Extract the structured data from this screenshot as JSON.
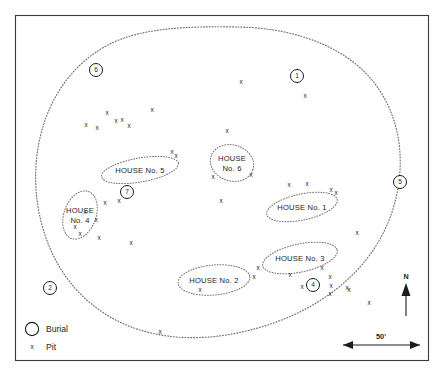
{
  "figure": {
    "type": "archaeological-site-plan"
  },
  "houses": [
    {
      "id": "house-1",
      "label": "HOUSE No. 1",
      "label_lines": [
        "HOUSE No. 1"
      ],
      "cx": 302,
      "cy": 207,
      "rx": 36,
      "ry": 13,
      "rotate": -12
    },
    {
      "id": "house-2",
      "label": "HOUSE No. 2",
      "label_lines": [
        "HOUSE No. 2"
      ],
      "cx": 214,
      "cy": 280,
      "rx": 36,
      "ry": 15,
      "rotate": -5
    },
    {
      "id": "house-3",
      "label": "HOUSE No. 3",
      "label_lines": [
        "HOUSE No. 3"
      ],
      "cx": 300,
      "cy": 258,
      "rx": 38,
      "ry": 14,
      "rotate": -12
    },
    {
      "id": "house-4",
      "label": "HOUSE No. 4",
      "label_lines": [
        "HOUSE",
        "No. 4"
      ],
      "cx": 80,
      "cy": 215,
      "rx": 16,
      "ry": 25,
      "rotate": 20
    },
    {
      "id": "house-5",
      "label": "HOUSE No. 5",
      "label_lines": [
        "HOUSE No. 5"
      ],
      "cx": 140,
      "cy": 170,
      "rx": 39,
      "ry": 12,
      "rotate": -10
    },
    {
      "id": "house-6",
      "label": "HOUSE No. 6",
      "label_lines": [
        "HOUSE",
        "No. 6"
      ],
      "cx": 232,
      "cy": 163,
      "rx": 22,
      "ry": 18,
      "rotate": 18
    }
  ],
  "burials": [
    {
      "id": "burial-6",
      "number": "6",
      "cx": 96,
      "cy": 70,
      "r": 6.5
    },
    {
      "id": "burial-1",
      "number": "1",
      "cx": 297,
      "cy": 76,
      "r": 6.5
    },
    {
      "id": "burial-5",
      "number": "5",
      "cx": 400,
      "cy": 182,
      "r": 6.5
    },
    {
      "id": "burial-7-house5",
      "number": "7",
      "cx": 127,
      "cy": 192,
      "r": 6.5
    },
    {
      "id": "burial-2",
      "number": "2",
      "cx": 50,
      "cy": 288,
      "r": 6.5
    },
    {
      "id": "burial-4",
      "number": "4",
      "cx": 313,
      "cy": 285,
      "r": 6.5
    }
  ],
  "pits": [
    {
      "x": 241,
      "y": 82
    },
    {
      "x": 305,
      "y": 96
    },
    {
      "x": 152,
      "y": 110
    },
    {
      "x": 107,
      "y": 113
    },
    {
      "x": 116,
      "y": 121
    },
    {
      "x": 122,
      "y": 120
    },
    {
      "x": 86,
      "y": 125
    },
    {
      "x": 97,
      "y": 128
    },
    {
      "x": 129,
      "y": 126
    },
    {
      "x": 227,
      "y": 131
    },
    {
      "x": 172,
      "y": 152
    },
    {
      "x": 176,
      "y": 156
    },
    {
      "x": 213,
      "y": 177
    },
    {
      "x": 251,
      "y": 175
    },
    {
      "x": 289,
      "y": 185
    },
    {
      "x": 307,
      "y": 184
    },
    {
      "x": 331,
      "y": 190
    },
    {
      "x": 336,
      "y": 193
    },
    {
      "x": 105,
      "y": 203
    },
    {
      "x": 119,
      "y": 201
    },
    {
      "x": 221,
      "y": 201
    },
    {
      "x": 85,
      "y": 212
    },
    {
      "x": 96,
      "y": 220
    },
    {
      "x": 75,
      "y": 227
    },
    {
      "x": 80,
      "y": 234
    },
    {
      "x": 99,
      "y": 238
    },
    {
      "x": 131,
      "y": 243
    },
    {
      "x": 357,
      "y": 233
    },
    {
      "x": 258,
      "y": 268
    },
    {
      "x": 254,
      "y": 277
    },
    {
      "x": 290,
      "y": 275
    },
    {
      "x": 322,
      "y": 268
    },
    {
      "x": 330,
      "y": 277
    },
    {
      "x": 331,
      "y": 286
    },
    {
      "x": 330,
      "y": 294
    },
    {
      "x": 302,
      "y": 287
    },
    {
      "x": 200,
      "y": 290
    },
    {
      "x": 347,
      "y": 288
    },
    {
      "x": 349,
      "y": 290
    },
    {
      "x": 160,
      "y": 332
    },
    {
      "x": 369,
      "y": 303
    }
  ],
  "legend": {
    "burial_label": "Burial",
    "pit_label": "Pit",
    "pit_symbol": "x"
  },
  "scale_bar": {
    "label": "50'"
  },
  "north_arrow": {
    "label": "N"
  },
  "colors": {
    "ink": "#1d1d1d",
    "dotted": "#6d6d6d",
    "frame": "#3a3a3a",
    "background": "#ffffff"
  }
}
